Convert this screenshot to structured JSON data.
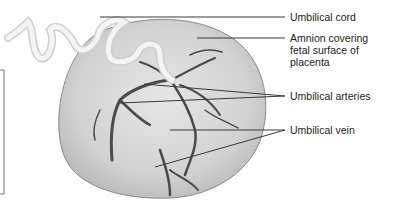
{
  "figure": {
    "labels": [
      {
        "id": "umbilical-cord",
        "text": "Umbilical cord"
      },
      {
        "id": "amnion",
        "text": "Amnion covering\nfetal surface of\nplacenta"
      },
      {
        "id": "umbilical-arteries",
        "text": "Umbilical arteries"
      },
      {
        "id": "umbilical-vein",
        "text": "Umbilical vein"
      }
    ]
  },
  "colors": {
    "leader_line": "#3a3a3a",
    "placenta_fill": "#d9d9d9",
    "placenta_edge": "#8a8a8a",
    "vessel": "#4a4a4a",
    "cord": "#f2f2f2",
    "text": "#222222"
  }
}
